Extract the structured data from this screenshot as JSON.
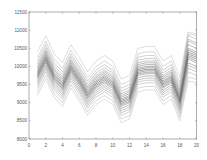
{
  "chart_data": {
    "type": "line",
    "title": "",
    "xlabel": "",
    "ylabel": "",
    "xlim": [
      0,
      20
    ],
    "ylim": [
      8000,
      11500
    ],
    "grid": false,
    "legend": null,
    "x_ticks": [
      "0",
      "2",
      "4",
      "6",
      "8",
      "10",
      "12",
      "14",
      "16",
      "18",
      "20"
    ],
    "y_ticks": [
      "8000",
      "8500",
      "9000",
      "9500",
      "10000",
      "10500",
      "11000",
      "11500"
    ],
    "x": [
      1,
      2,
      3,
      4,
      5,
      6,
      7,
      8,
      9,
      10,
      11,
      12,
      13,
      14,
      15,
      16,
      17,
      18,
      19,
      20
    ],
    "series": [
      {
        "name": "series-1",
        "values": [
          9200,
          9650,
          9150,
          8900,
          9400,
          9050,
          8650,
          8950,
          9100,
          8950,
          8450,
          8550,
          9300,
          9350,
          9350,
          8950,
          9100,
          8500,
          9600,
          9550
        ]
      },
      {
        "name": "series-2",
        "values": [
          9300,
          9750,
          9250,
          9000,
          9500,
          9150,
          8750,
          9050,
          9200,
          9050,
          8550,
          8650,
          9400,
          9450,
          9450,
          9050,
          9200,
          8600,
          9700,
          9650
        ]
      },
      {
        "name": "series-3",
        "values": [
          9400,
          9850,
          9350,
          9100,
          9600,
          9250,
          8850,
          9150,
          9300,
          9150,
          8650,
          8750,
          9500,
          9550,
          9550,
          9150,
          9300,
          8700,
          9850,
          9750
        ]
      },
      {
        "name": "series-4",
        "values": [
          9470,
          9920,
          9420,
          9170,
          9670,
          9320,
          8920,
          9220,
          9370,
          9220,
          8720,
          8820,
          9570,
          9620,
          9620,
          9220,
          9370,
          8770,
          9950,
          9850
        ]
      },
      {
        "name": "series-5",
        "values": [
          9530,
          9980,
          9480,
          9230,
          9730,
          9380,
          8980,
          9280,
          9430,
          9280,
          8780,
          8880,
          9630,
          9680,
          9680,
          9280,
          9430,
          8830,
          10030,
          9930
        ]
      },
      {
        "name": "series-6",
        "values": [
          9590,
          10040,
          9540,
          9290,
          9790,
          9440,
          9040,
          9340,
          9490,
          9340,
          8840,
          8940,
          9690,
          9740,
          9740,
          9340,
          9490,
          8890,
          10100,
          10000
        ]
      },
      {
        "name": "series-7",
        "values": [
          9650,
          10100,
          9600,
          9350,
          9850,
          9500,
          9100,
          9400,
          9550,
          9400,
          8900,
          9000,
          9750,
          9800,
          9800,
          9400,
          9550,
          8950,
          10200,
          10100
        ]
      },
      {
        "name": "series-8",
        "values": [
          9690,
          10140,
          9640,
          9390,
          9890,
          9540,
          9140,
          9440,
          9590,
          9440,
          8940,
          9040,
          9790,
          9840,
          9840,
          9440,
          9590,
          8990,
          10250,
          10150
        ]
      },
      {
        "name": "series-9",
        "values": [
          9730,
          10180,
          9680,
          9430,
          9930,
          9580,
          9180,
          9480,
          9630,
          9480,
          8980,
          9080,
          9830,
          9880,
          9880,
          9480,
          9630,
          9030,
          10300,
          10200
        ]
      },
      {
        "name": "series-10",
        "values": [
          9770,
          10220,
          9720,
          9470,
          9970,
          9620,
          9220,
          9520,
          9670,
          9520,
          9020,
          9120,
          9870,
          9920,
          9920,
          9520,
          9670,
          9070,
          10350,
          10250
        ]
      },
      {
        "name": "series-11",
        "values": [
          9810,
          10260,
          9760,
          9510,
          10010,
          9660,
          9260,
          9560,
          9710,
          9560,
          9060,
          9160,
          9910,
          9960,
          9960,
          9560,
          9710,
          9110,
          10400,
          10300
        ]
      },
      {
        "name": "series-12",
        "values": [
          9850,
          10300,
          9800,
          9550,
          10050,
          9700,
          9300,
          9600,
          9750,
          9600,
          9100,
          9200,
          9950,
          10000,
          10000,
          9600,
          9750,
          9150,
          10450,
          10350
        ]
      },
      {
        "name": "series-13",
        "values": [
          9900,
          10350,
          9850,
          9600,
          10100,
          9750,
          9350,
          9650,
          9800,
          9650,
          9150,
          9250,
          10000,
          10050,
          10050,
          9650,
          9800,
          9200,
          10500,
          10400
        ]
      },
      {
        "name": "series-14",
        "values": [
          9950,
          10400,
          9900,
          9650,
          10150,
          9800,
          9400,
          9700,
          9850,
          9700,
          9200,
          9300,
          10050,
          10100,
          10100,
          9700,
          9850,
          9250,
          10600,
          10500
        ]
      },
      {
        "name": "series-15",
        "values": [
          10000,
          10450,
          9950,
          9700,
          10200,
          9850,
          9450,
          9750,
          9900,
          9750,
          9250,
          9350,
          10100,
          10150,
          10150,
          9750,
          9900,
          9300,
          10700,
          10600
        ]
      },
      {
        "name": "series-16",
        "values": [
          10070,
          10520,
          10020,
          9770,
          10270,
          9920,
          9520,
          9820,
          9970,
          9820,
          9320,
          9420,
          10170,
          10220,
          10220,
          9820,
          9970,
          9370,
          10750,
          10650
        ]
      },
      {
        "name": "series-17",
        "values": [
          10150,
          10600,
          10100,
          9850,
          10350,
          10000,
          9600,
          9900,
          10050,
          9900,
          9400,
          9500,
          10250,
          10300,
          10300,
          9900,
          10050,
          9450,
          10850,
          10750
        ]
      },
      {
        "name": "series-18",
        "values": [
          10250,
          10700,
          10200,
          9950,
          10450,
          10100,
          9700,
          10000,
          10150,
          10000,
          9500,
          9600,
          10350,
          10400,
          10400,
          10000,
          10150,
          9550,
          10900,
          10850
        ]
      },
      {
        "name": "series-19",
        "values": [
          10400,
          10850,
          10350,
          10100,
          10600,
          10250,
          9850,
          10150,
          10300,
          10150,
          9650,
          9750,
          10500,
          10550,
          10550,
          10150,
          10300,
          9700,
          10950,
          10900
        ]
      }
    ],
    "colors": {
      "frame": "#777777",
      "series_dark": "#555555",
      "series_light": "#bbbbbb"
    }
  }
}
